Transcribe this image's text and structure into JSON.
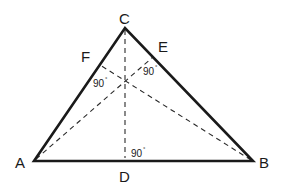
{
  "diagram": {
    "vertices": {
      "A": {
        "label": "A",
        "x": 34,
        "y": 161
      },
      "B": {
        "label": "B",
        "x": 253,
        "y": 161
      },
      "C": {
        "label": "C",
        "x": 125,
        "y": 28
      }
    },
    "feet": {
      "D": {
        "label": "D",
        "x": 125,
        "y": 161,
        "on": "AB"
      },
      "E": {
        "label": "E",
        "x": 153,
        "y": 57,
        "on": "BC"
      },
      "F": {
        "label": "F",
        "x": 100,
        "y": 65,
        "on": "AC"
      }
    },
    "altitudes": [
      "CD",
      "AE",
      "BF"
    ],
    "orthocenter": {
      "x": 124,
      "y": 82
    },
    "right_angle_labels": {
      "at_F": {
        "value": "90",
        "unit": "°"
      },
      "at_E": {
        "value": "90",
        "unit": "°"
      },
      "at_D": {
        "value": "90",
        "unit": "°"
      }
    },
    "colors": {
      "line": "#1a1a1a",
      "background": "#ffffff"
    }
  }
}
